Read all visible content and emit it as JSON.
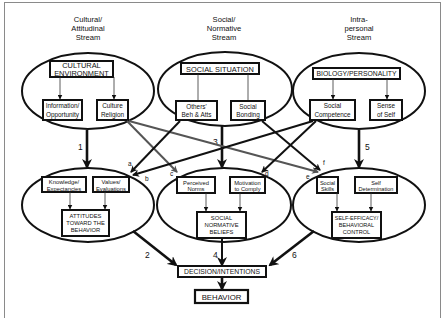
{
  "diagram": {
    "streams": [
      {
        "id": "cultural",
        "title_lines": [
          "Cultural/",
          "Attitudinal",
          "Stream"
        ]
      },
      {
        "id": "social",
        "title_lines": [
          "Social/",
          "Normative",
          "Stream"
        ]
      },
      {
        "id": "intrapersonal",
        "title_lines": [
          "Intra-",
          "personal",
          "Stream"
        ]
      }
    ],
    "top_level": {
      "cultural": {
        "main": [
          "CULTURAL",
          "ENVIRONMENT"
        ],
        "children": [
          [
            "Information/",
            "Opportunity"
          ],
          [
            "Culture",
            "Religion"
          ]
        ]
      },
      "social": {
        "main": [
          "SOCIAL SITUATION"
        ],
        "children": [
          [
            "Others'",
            "Beh & Atts"
          ],
          [
            "Social",
            "Bonding"
          ]
        ]
      },
      "intrapersonal": {
        "main": [
          "BIOLOGY/PERSONALITY"
        ],
        "children": [
          [
            "Social",
            "Competence"
          ],
          [
            "Sense",
            "of Self"
          ]
        ]
      }
    },
    "mid_level": {
      "cultural": {
        "children": [
          [
            "Knowledge/",
            "Expectancies"
          ],
          [
            "Values/",
            "Evaluations"
          ]
        ],
        "main": [
          "ATTITUDES",
          "TOWARD THE",
          "BEHAVIOR"
        ]
      },
      "social": {
        "children": [
          [
            "Perceived",
            "Norms"
          ],
          [
            "Motivation",
            "to Comply"
          ]
        ],
        "main": [
          "SOCIAL",
          "NORMATIVE",
          "BELIEFS"
        ]
      },
      "intrapersonal": {
        "children": [
          [
            "Social",
            "Skills"
          ],
          [
            "Self",
            "Determination"
          ]
        ],
        "main": [
          "SELF-EFFICACY/",
          "BEHAVIORAL",
          "CONTROL"
        ]
      }
    },
    "decision": "DECISION/INTENTIONS",
    "behavior": "BEHAVIOR",
    "path_numbers": [
      "1",
      "2",
      "3",
      "4",
      "5",
      "6"
    ],
    "cross_path_letters": [
      "a",
      "b",
      "c",
      "d",
      "e",
      "f"
    ],
    "colors": {
      "line": "#111111",
      "cross_line_gray": "#666666",
      "frame": "#8a8a8a",
      "background": "#ffffff"
    }
  }
}
